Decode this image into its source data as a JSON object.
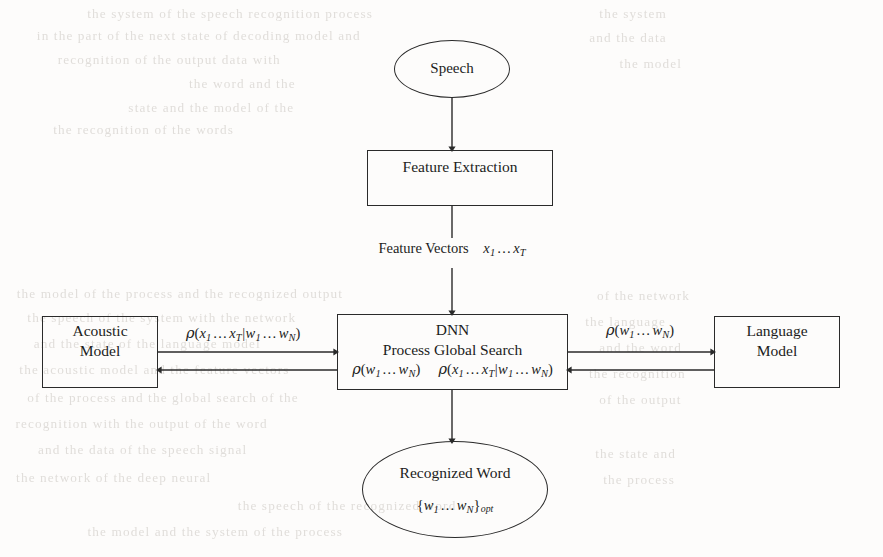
{
  "diagram": {
    "type": "flowchart",
    "background_color": "#fdfcfb",
    "stroke_color": "#2a2a2a",
    "nodes": {
      "speech": {
        "shape": "ellipse",
        "label": "Speech"
      },
      "feature_extraction": {
        "shape": "rectangle",
        "label": "Feature Extraction"
      },
      "dnn": {
        "shape": "rectangle",
        "line1": "DNN",
        "line2": "Process Global Search",
        "math_left": "ρ(w₁…wₙ)",
        "math_right": "ρ(x₁…xₜ|w₁…wₙ)"
      },
      "acoustic_model": {
        "shape": "rectangle",
        "line1": "Acoustic",
        "line2": "Model"
      },
      "language_model": {
        "shape": "rectangle",
        "line1": "Language",
        "line2": "Model"
      },
      "recognized_word": {
        "shape": "ellipse",
        "line1": "Recognized Word",
        "math": "{w₁…wₙ}ₒₚₜ"
      }
    },
    "edge_labels": {
      "feature_vectors": "Feature Vectors",
      "feature_vectors_math": "x₁…xₜ",
      "acoustic_prob": "ρ(x₁…xₜ|w₁…wₙ)",
      "language_prob": "ρ(w₁…wₙ)"
    },
    "ghost_text": [
      {
        "x": 90,
        "y": 6,
        "text": "the  system  of  the  speech  recognition  process"
      },
      {
        "x": 40,
        "y": 28,
        "text": "in  the  part  of  the  next  state  of  decoding  model  and"
      },
      {
        "x": 60,
        "y": 52,
        "text": "recognition   of   the   output   data   with"
      },
      {
        "x": 190,
        "y": 76,
        "text": "the   word   and   the"
      },
      {
        "x": 130,
        "y": 100,
        "text": "state   and   the   model   of   the"
      },
      {
        "x": 55,
        "y": 122,
        "text": "the   recognition   of   the   words"
      },
      {
        "x": 20,
        "y": 286,
        "text": "the  model  of  the  process  and  the  recognized  output"
      },
      {
        "x": 30,
        "y": 310,
        "text": "the   speech   of   the   system   with   the   network"
      },
      {
        "x": 36,
        "y": 336,
        "text": "and   the   state   of   the   language   model"
      },
      {
        "x": 22,
        "y": 362,
        "text": "the   acoustic   model   and   the   feature   vectors"
      },
      {
        "x": 30,
        "y": 390,
        "text": "of   the   process   and   the   global   search   of   the"
      },
      {
        "x": 18,
        "y": 416,
        "text": "recognition   with   the   output   of   the   word"
      },
      {
        "x": 40,
        "y": 442,
        "text": "and   the   data   of   the   speech   signal"
      },
      {
        "x": 18,
        "y": 470,
        "text": "the   network   of   the   deep   neural"
      },
      {
        "x": 240,
        "y": 498,
        "text": "the   speech   of   the   recognized   word"
      },
      {
        "x": 90,
        "y": 524,
        "text": "the   model   and   the   system   of   the   process"
      },
      {
        "x": 600,
        "y": 6,
        "text": "the   system"
      },
      {
        "x": 590,
        "y": 30,
        "text": "and   the   data"
      },
      {
        "x": 620,
        "y": 56,
        "text": "the   model"
      },
      {
        "x": 598,
        "y": 288,
        "text": "of   the   network"
      },
      {
        "x": 586,
        "y": 314,
        "text": "the   language"
      },
      {
        "x": 600,
        "y": 340,
        "text": "and   the   word"
      },
      {
        "x": 590,
        "y": 366,
        "text": "the   recognition"
      },
      {
        "x": 600,
        "y": 392,
        "text": "of   the   output"
      },
      {
        "x": 596,
        "y": 446,
        "text": "the   state   and"
      },
      {
        "x": 604,
        "y": 472,
        "text": "the   process"
      }
    ]
  }
}
